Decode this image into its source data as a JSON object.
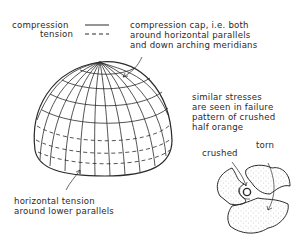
{
  "legend": {
    "compression_label": "compression",
    "tension_label": "tension"
  },
  "annotations": {
    "cap": [
      "compression cap, i.e. both",
      "around horizontal parallels",
      "and down arching meridians"
    ],
    "lower": [
      "horizontal tension",
      "around lower parallels"
    ],
    "orange": [
      "similar stresses",
      "are seen in failure",
      "pattern of crushed",
      "half orange"
    ],
    "crushed": "crushed",
    "torn": "torn"
  },
  "colors": {
    "ink": "#2a2a2a",
    "stipple": "#9a9a9a",
    "background": "#ffffff"
  }
}
